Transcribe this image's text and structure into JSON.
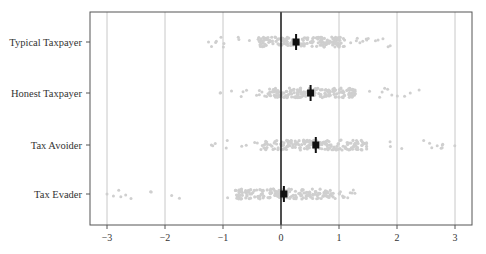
{
  "chart_data": {
    "type": "scatter",
    "subtype": "strip plot with mean and error bars",
    "title": "",
    "xlabel": "",
    "ylabel": "",
    "xlim": [
      -3.3,
      3.3
    ],
    "xticks": [
      -3,
      -2,
      -1,
      0,
      1,
      2,
      3
    ],
    "xtick_labels": [
      "−3",
      "−2",
      "−1",
      "0",
      "1",
      "2",
      "3"
    ],
    "grid": "vertical",
    "reference_line_x": 0,
    "categories": [
      "Typical Taxpayer",
      "Honest Taxpayer",
      "Tax Avoider",
      "Tax Evader"
    ],
    "series": [
      {
        "name": "Typical Taxpayer",
        "mean": 0.26,
        "ci": [
          0.21,
          0.31
        ],
        "range": [
          -1.25,
          1.95
        ],
        "core": [
          -0.4,
          1.1
        ]
      },
      {
        "name": "Honest Taxpayer",
        "mean": 0.51,
        "ci": [
          0.46,
          0.56
        ],
        "range": [
          -1.05,
          2.5
        ],
        "core": [
          -0.2,
          1.3
        ]
      },
      {
        "name": "Tax Avoider",
        "mean": 0.6,
        "ci": [
          0.55,
          0.65
        ],
        "range": [
          -1.2,
          3.0
        ],
        "core": [
          -0.3,
          1.5
        ]
      },
      {
        "name": "Tax Evader",
        "mean": 0.05,
        "ci": [
          0.0,
          0.1
        ],
        "range": [
          -3.0,
          1.3
        ],
        "core": [
          -0.8,
          0.9
        ]
      }
    ],
    "colors": {
      "points": "#cfcfcf",
      "mean": "#111111",
      "grid": "#c8c8c8",
      "frame": "#555555",
      "zero_line": "#222222"
    }
  }
}
